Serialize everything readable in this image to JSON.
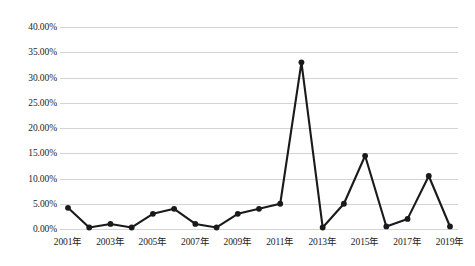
{
  "chart_data": {
    "type": "line",
    "title": "",
    "xlabel": "",
    "ylabel": "",
    "categories": [
      "2001年",
      "2002年",
      "2003年",
      "2004年",
      "2005年",
      "2006年",
      "2007年",
      "2008年",
      "2009年",
      "2010年",
      "2011年",
      "2012年",
      "2013年",
      "2014年",
      "2015年",
      "2016年",
      "2017年",
      "2018年",
      "2019年"
    ],
    "values": [
      4.2,
      0.3,
      1.0,
      0.3,
      3.0,
      4.0,
      1.0,
      0.3,
      3.0,
      4.0,
      5.0,
      33.0,
      0.3,
      5.0,
      14.5,
      0.5,
      2.0,
      10.5,
      0.5
    ],
    "value_unit": "%",
    "ylim": [
      0,
      40
    ],
    "ytick_values": [
      0,
      5,
      10,
      15,
      20,
      25,
      30,
      35,
      40
    ],
    "ytick_labels": [
      "0.00%",
      "5.00%",
      "10.00%",
      "15.00%",
      "20.00%",
      "25.00%",
      "30.00%",
      "35.00%",
      "40.00%"
    ],
    "xtick_labels": [
      "2001年",
      "2003年",
      "2005年",
      "2007年",
      "2009年",
      "2011年",
      "2013年",
      "2015年",
      "2017年",
      "2019年"
    ],
    "xtick_categories": [
      "2001年",
      "2003年",
      "2005年",
      "2007年",
      "2009年",
      "2011年",
      "2013年",
      "2015年",
      "2017年",
      "2019年"
    ],
    "grid": true,
    "grid_axis": "y",
    "grid_color": "#d4d4d4",
    "legend": false,
    "legend_position": "none",
    "series_color": "#1a1a1a",
    "marker": "circle",
    "background_color": "#ffffff"
  }
}
